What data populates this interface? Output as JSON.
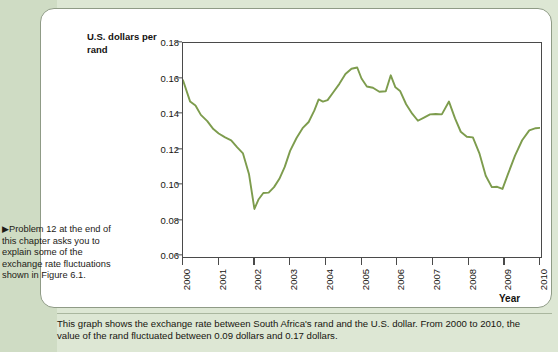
{
  "figure": {
    "y_axis_title": "U.S. dollars per rand",
    "x_axis_title": "Year",
    "side_note": "▶Problem 12 at the end of this chapter asks you to explain some of the exchange rate fluctuations shown in Figure 6.1.",
    "caption": "This graph shows the exchange rate between South Africa's rand and the U.S. dollar. From 2000 to 2010, the value of the rand fluctuated between 0.09 dollars and 0.17 dollars.",
    "line_color": "#7d9c4d",
    "axis_color": "#4a4a4a",
    "panel_background": "#ffffff",
    "page_background": "#dde7d4"
  },
  "chart_data": {
    "type": "line",
    "title": "",
    "xlabel": "Year",
    "ylabel": "U.S. dollars per rand",
    "xlim": [
      2000,
      2010
    ],
    "ylim": [
      0.06,
      0.18
    ],
    "yticks": [
      0.06,
      0.08,
      0.1,
      0.12,
      0.14,
      0.16,
      0.18
    ],
    "ytick_labels": [
      "0.06",
      "0.08",
      "0.10",
      "0.12",
      "0.14",
      "0.16",
      "0.18"
    ],
    "xticks": [
      2000,
      2001,
      2002,
      2003,
      2004,
      2005,
      2006,
      2007,
      2008,
      2009,
      2010
    ],
    "xtick_labels": [
      "2000",
      "2001",
      "2002",
      "2003",
      "2004",
      "2005",
      "2006",
      "2007",
      "2008",
      "2009",
      "2010"
    ],
    "grid": false,
    "legend": false,
    "series": [
      {
        "name": "U.S. dollars per rand",
        "color": "#7d9c4d",
        "x": [
          2000.0,
          2000.2,
          2000.35,
          2000.5,
          2000.68,
          2000.85,
          2001.0,
          2001.18,
          2001.35,
          2001.52,
          2001.68,
          2001.85,
          2002.0,
          2002.12,
          2002.25,
          2002.4,
          2002.55,
          2002.7,
          2002.85,
          2003.0,
          2003.18,
          2003.35,
          2003.52,
          2003.68,
          2003.8,
          2003.92,
          2004.05,
          2004.2,
          2004.38,
          2004.55,
          2004.72,
          2004.88,
          2005.0,
          2005.15,
          2005.32,
          2005.5,
          2005.68,
          2005.82,
          2005.95,
          2006.08,
          2006.25,
          2006.42,
          2006.58,
          2006.75,
          2006.92,
          2007.08,
          2007.25,
          2007.45,
          2007.62,
          2007.78,
          2007.95,
          2008.12,
          2008.3,
          2008.48,
          2008.65,
          2008.8,
          2008.95,
          2009.1,
          2009.3,
          2009.5,
          2009.7,
          2009.88,
          2010.0
        ],
        "y": [
          0.159,
          0.147,
          0.1448,
          0.1395,
          0.136,
          0.1315,
          0.129,
          0.1268,
          0.1252,
          0.1212,
          0.1178,
          0.106,
          0.0865,
          0.092,
          0.0955,
          0.0957,
          0.0988,
          0.1035,
          0.1102,
          0.1192,
          0.1265,
          0.132,
          0.1355,
          0.142,
          0.1482,
          0.147,
          0.1478,
          0.152,
          0.157,
          0.1625,
          0.1655,
          0.1662,
          0.16,
          0.1555,
          0.1548,
          0.1525,
          0.1528,
          0.1618,
          0.155,
          0.153,
          0.1455,
          0.1402,
          0.1362,
          0.138,
          0.1398,
          0.14,
          0.1398,
          0.147,
          0.1375,
          0.13,
          0.1272,
          0.1268,
          0.118,
          0.1052,
          0.0988,
          0.099,
          0.0978,
          0.106,
          0.1165,
          0.1252,
          0.1308,
          0.132,
          0.1322
        ]
      }
    ],
    "annotations": [
      {
        "text": "fluctuated between 0.09 dollars and 0.17 dollars",
        "kind": "caption-range"
      }
    ]
  }
}
